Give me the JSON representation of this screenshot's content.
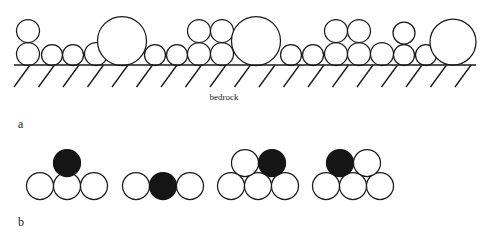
{
  "figure": {
    "background_color": "#ffffff",
    "stroke_color": "#1a1a1a",
    "fill_color": "#151515",
    "open_fill_color": "#ffffff",
    "width": 498,
    "height": 240
  },
  "panel_a": {
    "label": "a",
    "label_x": 18,
    "label_y": 128,
    "bedrock_caption": "bedrock",
    "bedrock_caption_x": 224,
    "bedrock_caption_y": 100,
    "baseline": {
      "x1": 14,
      "y1": 65,
      "x2": 476,
      "y2": 65
    },
    "hatching": {
      "count": 19,
      "start_x": 30,
      "spacing": 24.5,
      "dx": -16,
      "dy": 22,
      "description": "parallel slanted tick marks below bedrock line"
    },
    "grains": [
      {
        "cx": 28,
        "cy": 54,
        "r": 11.5
      },
      {
        "cx": 28,
        "cy": 31,
        "r": 11.5
      },
      {
        "cx": 52,
        "cy": 55,
        "r": 10.5
      },
      {
        "cx": 73,
        "cy": 55,
        "r": 10.5
      },
      {
        "cx": 96,
        "cy": 54,
        "r": 11.5
      },
      {
        "cx": 122,
        "cy": 41,
        "r": 24.5
      },
      {
        "cx": 155,
        "cy": 55,
        "r": 10.5
      },
      {
        "cx": 177,
        "cy": 55,
        "r": 10.5
      },
      {
        "cx": 199,
        "cy": 54,
        "r": 11.5
      },
      {
        "cx": 199,
        "cy": 31,
        "r": 11.5
      },
      {
        "cx": 222,
        "cy": 54,
        "r": 11.5
      },
      {
        "cx": 222,
        "cy": 31,
        "r": 11.5
      },
      {
        "cx": 256,
        "cy": 41,
        "r": 24.5
      },
      {
        "cx": 291,
        "cy": 55,
        "r": 10.5
      },
      {
        "cx": 313,
        "cy": 55,
        "r": 10.5
      },
      {
        "cx": 336,
        "cy": 54,
        "r": 11.5
      },
      {
        "cx": 336,
        "cy": 31,
        "r": 11.5
      },
      {
        "cx": 359,
        "cy": 54,
        "r": 11.5
      },
      {
        "cx": 359,
        "cy": 31,
        "r": 11.5
      },
      {
        "cx": 382,
        "cy": 54,
        "r": 11.5
      },
      {
        "cx": 404,
        "cy": 55,
        "r": 10.5
      },
      {
        "cx": 404,
        "cy": 33,
        "r": 11.0
      },
      {
        "cx": 426,
        "cy": 55,
        "r": 10.5
      },
      {
        "cx": 453,
        "cy": 42,
        "r": 23.0
      }
    ]
  },
  "panel_b": {
    "label": "b",
    "label_x": 18,
    "label_y": 226,
    "grain_radius": 13.5,
    "configurations": [
      {
        "name": "config-1-grain-on-top-of-three",
        "grains": [
          {
            "cx": 40,
            "cy": 186,
            "r": 13.5,
            "filled": false
          },
          {
            "cx": 67,
            "cy": 186,
            "r": 13.5,
            "filled": false
          },
          {
            "cx": 94,
            "cy": 186,
            "r": 13.5,
            "filled": false
          },
          {
            "cx": 67,
            "cy": 163,
            "r": 13.5,
            "filled": true
          }
        ]
      },
      {
        "name": "config-2-grain-in-row",
        "grains": [
          {
            "cx": 136,
            "cy": 186,
            "r": 13.5,
            "filled": false
          },
          {
            "cx": 163,
            "cy": 186,
            "r": 13.5,
            "filled": true
          },
          {
            "cx": 190,
            "cy": 186,
            "r": 13.5,
            "filled": false
          }
        ]
      },
      {
        "name": "config-3-grain-upper-right",
        "grains": [
          {
            "cx": 231,
            "cy": 186,
            "r": 13.5,
            "filled": false
          },
          {
            "cx": 258,
            "cy": 186,
            "r": 13.5,
            "filled": false
          },
          {
            "cx": 285,
            "cy": 186,
            "r": 13.5,
            "filled": false
          },
          {
            "cx": 245,
            "cy": 163,
            "r": 13.5,
            "filled": false
          },
          {
            "cx": 272,
            "cy": 163,
            "r": 13.5,
            "filled": true
          }
        ]
      },
      {
        "name": "config-4-grain-upper-left",
        "grains": [
          {
            "cx": 326,
            "cy": 186,
            "r": 13.5,
            "filled": false
          },
          {
            "cx": 353,
            "cy": 186,
            "r": 13.5,
            "filled": false
          },
          {
            "cx": 380,
            "cy": 186,
            "r": 13.5,
            "filled": false
          },
          {
            "cx": 340,
            "cy": 163,
            "r": 13.5,
            "filled": true
          },
          {
            "cx": 367,
            "cy": 163,
            "r": 13.5,
            "filled": false
          }
        ]
      }
    ]
  }
}
